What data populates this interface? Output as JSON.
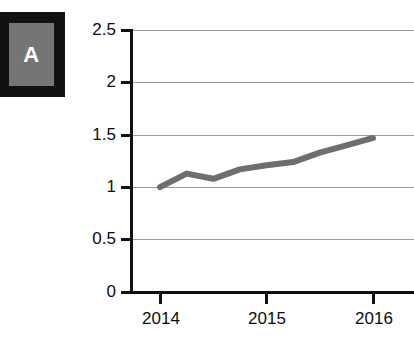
{
  "panel": {
    "label": "A",
    "box_fill": "#757575",
    "box_border": "#111111",
    "label_color": "#ffffff"
  },
  "chart_data": {
    "type": "line",
    "title": "",
    "xlabel": "",
    "ylabel": "",
    "xlim": [
      2013.75,
      2016.25
    ],
    "ylim": [
      0,
      2.5
    ],
    "grid": true,
    "grid_color": "#9a9a9a",
    "legend": "none",
    "y_ticks": [
      0,
      0.5,
      1,
      1.5,
      2,
      2.5
    ],
    "y_tick_labels": [
      "0",
      "0.5",
      "1",
      "1.5",
      "2",
      "2.5"
    ],
    "x_ticks": [
      2014,
      2015,
      2016
    ],
    "x_tick_labels": [
      "2014",
      "2015",
      "2016"
    ],
    "series": [
      {
        "name": "series-1",
        "color": "#6e6e6e",
        "line_width": 6,
        "x": [
          2014,
          2014.25,
          2014.5,
          2014.75,
          2015,
          2015.25,
          2015.5,
          2015.75,
          2016
        ],
        "values": [
          1.0,
          1.13,
          1.08,
          1.17,
          1.21,
          1.24,
          1.33,
          1.4,
          1.47
        ]
      }
    ]
  }
}
